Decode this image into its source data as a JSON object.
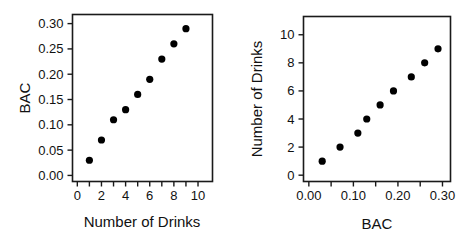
{
  "figure": {
    "background_color": "#ffffff",
    "point_color": "#000000",
    "axis_color": "#1a1a1a",
    "panel_count": 2
  },
  "chart_data": [
    {
      "type": "scatter",
      "title": "",
      "xlabel": "Number of Drinks",
      "ylabel": "BAC",
      "x": [
        1,
        2,
        3,
        4,
        5,
        6,
        7,
        8,
        9
      ],
      "y": [
        0.03,
        0.07,
        0.11,
        0.13,
        0.16,
        0.19,
        0.23,
        0.26,
        0.29
      ],
      "xlim": [
        -0.4,
        11.2
      ],
      "ylim": [
        -0.012,
        0.318
      ],
      "xticks": [
        0,
        1,
        2,
        3,
        4,
        5,
        6,
        7,
        8,
        9,
        10
      ],
      "xtick_labels": [
        "0",
        "",
        "2",
        "",
        "4",
        "",
        "6",
        "",
        "8",
        "",
        "10"
      ],
      "yticks": [
        0.0,
        0.05,
        0.1,
        0.15,
        0.2,
        0.25,
        0.3
      ],
      "ytick_labels": [
        "0.00",
        "0.05",
        "0.10",
        "0.15",
        "0.20",
        "0.25",
        "0.30"
      ],
      "grid": false,
      "legend": false
    },
    {
      "type": "scatter",
      "title": "",
      "xlabel": "BAC",
      "ylabel": "Number of Drinks",
      "x": [
        0.03,
        0.07,
        0.11,
        0.13,
        0.16,
        0.19,
        0.23,
        0.26,
        0.29
      ],
      "y": [
        1,
        2,
        3,
        4,
        5,
        6,
        7,
        8,
        9
      ],
      "xlim": [
        -0.012,
        0.318
      ],
      "ylim": [
        -0.45,
        11.3
      ],
      "xticks": [
        0.0,
        0.05,
        0.1,
        0.15,
        0.2,
        0.25,
        0.3
      ],
      "xtick_labels": [
        "0.00",
        "",
        "0.10",
        "",
        "0.20",
        "",
        "0.30"
      ],
      "yticks": [
        0,
        2,
        4,
        6,
        8,
        10
      ],
      "ytick_labels": [
        "0",
        "2",
        "4",
        "6",
        "8",
        "10"
      ],
      "grid": false,
      "legend": false
    }
  ]
}
